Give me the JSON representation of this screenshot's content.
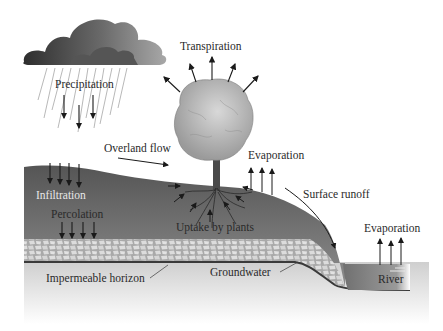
{
  "diagram": {
    "labels": {
      "precipitation": "Precipitation",
      "transpiration": "Transpiration",
      "overland_flow": "Overland flow",
      "evaporation_land": "Evaporation",
      "surface_runoff": "Surface runoff",
      "infiltration": "Infiltration",
      "percolation": "Percolation",
      "uptake_by_plants": "Uptake by plants",
      "evaporation_river": "Evaporation",
      "impermeable_horizon": "Impermeable horizon",
      "groundwater": "Groundwater",
      "river": "River"
    },
    "colors": {
      "cloud_dark": "#3a3a3a",
      "cloud_light": "#9a9a9a",
      "soil_dark": "#5e5e5e",
      "soil_mid": "#8a8a8a",
      "gravel": "#c8c8c8",
      "impermeable": "#d6d6d6",
      "river": "#7a7a7a",
      "tree_canopy": "#b5b5b5",
      "arrow": "#1a1a1a"
    }
  }
}
